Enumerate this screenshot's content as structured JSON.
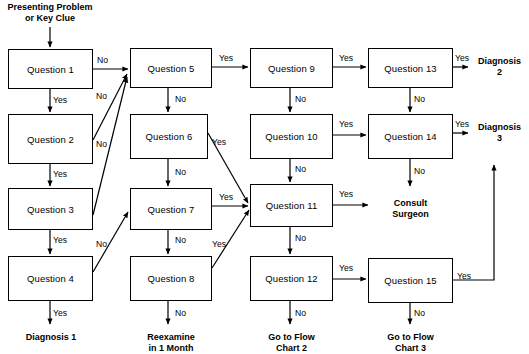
{
  "diagram": {
    "type": "flowchart",
    "canvas": {
      "width": 529,
      "height": 354
    },
    "entry_label": "Presenting Problem\nor Key Clue",
    "nodes": [
      {
        "id": "q1",
        "label": "Question 1",
        "x": 8,
        "y": 49,
        "w": 85,
        "h": 40
      },
      {
        "id": "q2",
        "label": "Question 2",
        "x": 8,
        "y": 114,
        "w": 85,
        "h": 50
      },
      {
        "id": "q3",
        "label": "Question 3",
        "x": 8,
        "y": 188,
        "w": 85,
        "h": 42
      },
      {
        "id": "q4",
        "label": "Question 4",
        "x": 8,
        "y": 256,
        "w": 85,
        "h": 45
      },
      {
        "id": "q5",
        "label": "Question 5",
        "x": 130,
        "y": 48,
        "w": 82,
        "h": 40
      },
      {
        "id": "q6",
        "label": "Question 6",
        "x": 130,
        "y": 114,
        "w": 78,
        "h": 45
      },
      {
        "id": "q7",
        "label": "Question 7",
        "x": 130,
        "y": 188,
        "w": 82,
        "h": 42
      },
      {
        "id": "q8",
        "label": "Question 8",
        "x": 130,
        "y": 256,
        "w": 82,
        "h": 45
      },
      {
        "id": "q9",
        "label": "Question 9",
        "x": 250,
        "y": 48,
        "w": 83,
        "h": 40
      },
      {
        "id": "q10",
        "label": "Question 10",
        "x": 250,
        "y": 114,
        "w": 83,
        "h": 45
      },
      {
        "id": "q11",
        "label": "Question 11",
        "x": 250,
        "y": 184,
        "w": 83,
        "h": 43
      },
      {
        "id": "q12",
        "label": "Question 12",
        "x": 250,
        "y": 256,
        "w": 83,
        "h": 45
      },
      {
        "id": "q13",
        "label": "Question 13",
        "x": 368,
        "y": 48,
        "w": 85,
        "h": 40
      },
      {
        "id": "q14",
        "label": "Question 14",
        "x": 368,
        "y": 114,
        "w": 85,
        "h": 45
      },
      {
        "id": "q15",
        "label": "Question 15",
        "x": 368,
        "y": 258,
        "w": 85,
        "h": 45
      }
    ],
    "terminals": [
      {
        "id": "diagnosis-1",
        "label": "Diagnosis 1",
        "x": 10,
        "y": 332,
        "w": 82
      },
      {
        "id": "reexamine",
        "label": "Reexamine\nin 1 Month",
        "x": 130,
        "y": 332,
        "w": 82
      },
      {
        "id": "goto-chart-2",
        "label": "Go to Flow\nChart 2",
        "x": 250,
        "y": 332,
        "w": 83
      },
      {
        "id": "goto-chart-3",
        "label": "Go to Flow\nChart 3",
        "x": 368,
        "y": 332,
        "w": 85
      },
      {
        "id": "consult-surgeon",
        "label": "Consult\nSurgeon",
        "x": 368,
        "y": 198,
        "w": 85
      },
      {
        "id": "diagnosis-2",
        "label": "Diagnosis\n2",
        "x": 470,
        "y": 56,
        "w": 59
      },
      {
        "id": "diagnosis-3",
        "label": "Diagnosis\n3",
        "x": 470,
        "y": 122,
        "w": 59
      }
    ],
    "edges": [
      {
        "id": "entry-q1",
        "from": "entry",
        "to": "q1",
        "label": ""
      },
      {
        "id": "q1-no-q5",
        "from": "q1",
        "to": "q5",
        "label": "No",
        "label_x": 97,
        "label_y": 56
      },
      {
        "id": "q1-yes-q2",
        "from": "q1",
        "to": "q2",
        "label": "Yes",
        "label_x": 53,
        "label_y": 96
      },
      {
        "id": "q2-no-q5",
        "from": "q2",
        "to": "q5",
        "label": "No",
        "label_x": 96,
        "label_y": 92
      },
      {
        "id": "q2-yes-q3",
        "from": "q2",
        "to": "q3",
        "label": "Yes",
        "label_x": 53,
        "label_y": 170
      },
      {
        "id": "q3-no-q5",
        "from": "q3",
        "to": "q5",
        "label": "No",
        "label_x": 96,
        "label_y": 140
      },
      {
        "id": "q3-yes-q4",
        "from": "q3",
        "to": "q4",
        "label": "Yes",
        "label_x": 53,
        "label_y": 236
      },
      {
        "id": "q4-no-q7",
        "from": "q4",
        "to": "q7",
        "label": "No",
        "label_x": 96,
        "label_y": 240
      },
      {
        "id": "q4-yes-d1",
        "from": "q4",
        "to": "diagnosis-1",
        "label": "Yes",
        "label_x": 53,
        "label_y": 309
      },
      {
        "id": "q5-yes-q9",
        "from": "q5",
        "to": "q9",
        "label": "Yes",
        "label_x": 219,
        "label_y": 54
      },
      {
        "id": "q5-no-q6",
        "from": "q5",
        "to": "q6",
        "label": "No",
        "label_x": 175,
        "label_y": 95
      },
      {
        "id": "q6-yes-q11",
        "from": "q6",
        "to": "q11",
        "label": "Yes",
        "label_x": 212,
        "label_y": 138
      },
      {
        "id": "q6-no-q7",
        "from": "q6",
        "to": "q7",
        "label": "No",
        "label_x": 175,
        "label_y": 168
      },
      {
        "id": "q7-yes-q11",
        "from": "q7",
        "to": "q11",
        "label": "Yes",
        "label_x": 219,
        "label_y": 193
      },
      {
        "id": "q7-no-q8",
        "from": "q7",
        "to": "q8",
        "label": "No",
        "label_x": 175,
        "label_y": 236
      },
      {
        "id": "q8-yes-q11",
        "from": "q8",
        "to": "q11",
        "label": "Yes",
        "label_x": 212,
        "label_y": 240
      },
      {
        "id": "q8-no-reex",
        "from": "q8",
        "to": "reexamine",
        "label": "No",
        "label_x": 175,
        "label_y": 309
      },
      {
        "id": "q9-yes-q13",
        "from": "q9",
        "to": "q13",
        "label": "Yes",
        "label_x": 339,
        "label_y": 54
      },
      {
        "id": "q9-no-q10",
        "from": "q9",
        "to": "q10",
        "label": "No",
        "label_x": 295,
        "label_y": 95
      },
      {
        "id": "q10-yes-q14",
        "from": "q10",
        "to": "q14",
        "label": "Yes",
        "label_x": 339,
        "label_y": 120
      },
      {
        "id": "q10-no-q11",
        "from": "q10",
        "to": "q11",
        "label": "No",
        "label_x": 295,
        "label_y": 165
      },
      {
        "id": "q11-yes-cs",
        "from": "q11",
        "to": "consult-surgeon",
        "label": "Yes",
        "label_x": 339,
        "label_y": 190
      },
      {
        "id": "q11-no-q12",
        "from": "q11",
        "to": "q12",
        "label": "No",
        "label_x": 295,
        "label_y": 234
      },
      {
        "id": "q12-yes-q15",
        "from": "q12",
        "to": "q15",
        "label": "Yes",
        "label_x": 339,
        "label_y": 264
      },
      {
        "id": "q12-no-fc2",
        "from": "q12",
        "to": "goto-chart-2",
        "label": "No",
        "label_x": 295,
        "label_y": 309
      },
      {
        "id": "q13-yes-d2",
        "from": "q13",
        "to": "diagnosis-2",
        "label": "Yes",
        "label_x": 455,
        "label_y": 54
      },
      {
        "id": "q13-no-q14",
        "from": "q13",
        "to": "q14",
        "label": "No",
        "label_x": 414,
        "label_y": 95
      },
      {
        "id": "q14-yes-d3",
        "from": "q14",
        "to": "diagnosis-3",
        "label": "Yes",
        "label_x": 455,
        "label_y": 120
      },
      {
        "id": "q14-no-q15",
        "from": "q14",
        "to": "q15",
        "label": "No",
        "label_x": 414,
        "label_y": 167
      },
      {
        "id": "q15-yes-d3",
        "from": "q15",
        "to": "diagnosis-3",
        "label": "Yes",
        "label_x": 457,
        "label_y": 272
      },
      {
        "id": "q15-no-fc3",
        "from": "q15",
        "to": "goto-chart-3",
        "label": "No",
        "label_x": 414,
        "label_y": 309
      }
    ]
  }
}
